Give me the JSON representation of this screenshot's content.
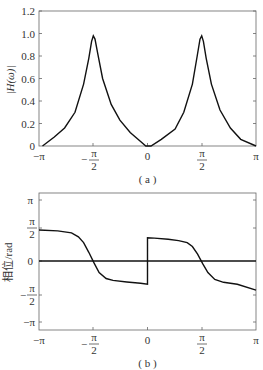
{
  "chart_data": [
    {
      "type": "line",
      "title": "",
      "caption": "( a )",
      "xlabel": "",
      "ylabel": "|H(ω)|",
      "xlim": [
        -3.1416,
        3.1416
      ],
      "ylim": [
        0,
        1.2
      ],
      "xticks": [
        "−π",
        "−π/2",
        "0",
        "π/2",
        "π"
      ],
      "yticks": [
        "0",
        "0.2",
        "0.4",
        "0.6",
        "0.8",
        "1.0",
        "1.2"
      ],
      "grid": false,
      "legend": null,
      "series": [
        {
          "name": "magnitude",
          "x": [
            -3.04,
            -2.7,
            -2.4,
            -2.1,
            -1.85,
            -1.7,
            -1.62,
            -1.57,
            -1.52,
            -1.44,
            -1.3,
            -1.05,
            -0.8,
            -0.5,
            -0.2,
            -0.05,
            0.1,
            0.4,
            0.8,
            1.05,
            1.3,
            1.44,
            1.52,
            1.57,
            1.62,
            1.7,
            1.85,
            2.1,
            2.4,
            2.7,
            3.1416
          ],
          "y": [
            0.0,
            0.08,
            0.16,
            0.3,
            0.55,
            0.78,
            0.93,
            0.98,
            0.95,
            0.82,
            0.6,
            0.37,
            0.23,
            0.12,
            0.04,
            0.0,
            0.0,
            0.06,
            0.15,
            0.3,
            0.55,
            0.8,
            0.95,
            0.98,
            0.93,
            0.78,
            0.55,
            0.32,
            0.16,
            0.06,
            0.0
          ]
        }
      ]
    },
    {
      "type": "line",
      "title": "",
      "caption": "( b )",
      "xlabel": "",
      "ylabel": "相位/rad",
      "xlim": [
        -3.1416,
        3.1416
      ],
      "ylim": [
        -3.6,
        3.6
      ],
      "xticks": [
        "−π",
        "−π/2",
        "0",
        "π/2",
        "π"
      ],
      "yticks": [
        "−π",
        "−π/2",
        "0",
        "π/2",
        "π"
      ],
      "grid": false,
      "legend": null,
      "series": [
        {
          "name": "phase",
          "x": [
            -3.1416,
            -2.6,
            -2.2,
            -2.0,
            -1.85,
            -1.7,
            -1.55,
            -1.4,
            -1.2,
            -1.0,
            -0.6,
            -0.2,
            0.0,
            0.0,
            0.2,
            0.6,
            0.9,
            1.15,
            1.3,
            1.45,
            1.6,
            1.75,
            1.95,
            2.2,
            2.6,
            3.1416
          ],
          "y": [
            1.6,
            1.55,
            1.45,
            1.25,
            0.95,
            0.45,
            -0.1,
            -0.6,
            -0.9,
            -1.0,
            -1.08,
            -1.15,
            -1.2,
            1.2,
            1.18,
            1.12,
            1.05,
            0.95,
            0.75,
            0.35,
            -0.15,
            -0.6,
            -0.95,
            -1.1,
            -1.2,
            -1.5
          ]
        },
        {
          "name": "zero-reference",
          "x": [
            -3.1416,
            3.1416
          ],
          "y": [
            0,
            0
          ]
        }
      ]
    }
  ],
  "labels": {
    "a": {
      "ylabel": "|H(ω)|",
      "caption": "( a )",
      "yticks": [
        "0",
        "0.2",
        "0.4",
        "0.6",
        "0.8",
        "1.0",
        "1.2"
      ],
      "xticks": [
        "−π",
        "−",
        "0",
        "π"
      ],
      "pi_half_num": "π",
      "pi_half_den": "2"
    },
    "b": {
      "ylabel": "相位/rad",
      "caption": "( b )",
      "ytick_pi": "π",
      "ytick_0": "0",
      "ytick_neg_pi": "−π",
      "xtick_neg_pi": "−π",
      "xtick_0": "0",
      "xtick_pi": "π",
      "minus": "−",
      "pi_half_num": "π",
      "pi_half_den": "2"
    }
  },
  "colors": {
    "line": "#111111",
    "axis": "#555555",
    "text": "#333333"
  }
}
